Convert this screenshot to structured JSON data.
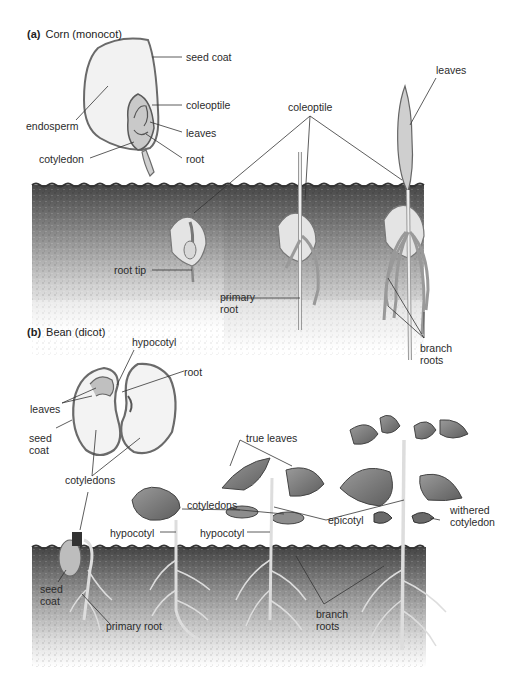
{
  "figure": {
    "colors": {
      "soil_top": "#4a4a4a",
      "soil_bottom": "#f4f4f4",
      "line": "#333333",
      "plant_fill": "#e6e6e6",
      "plant_outline": "#6a6a6a",
      "leaf_dark": "#7a7a7a"
    }
  },
  "panel_a": {
    "letter": "(a)",
    "title": "Corn (monocot)",
    "seed_labels": {
      "seed_coat": "seed coat",
      "endosperm": "endosperm",
      "coleoptile": "coleoptile",
      "leaves": "leaves",
      "cotyledon": "cotyledon",
      "root": "root"
    },
    "seedling_labels": {
      "coleoptile": "coleoptile",
      "leaves": "leaves",
      "root_tip": "root tip",
      "primary_root_1": "primary",
      "primary_root_2": "root",
      "branch_roots_1": "branch",
      "branch_roots_2": "roots"
    }
  },
  "panel_b": {
    "letter": "(b)",
    "title": "Bean (dicot)",
    "seed_labels": {
      "hypocotyl": "hypocotyl",
      "root": "root",
      "leaves": "leaves",
      "seed_coat_1": "seed",
      "seed_coat_2": "coat",
      "cotyledons": "cotyledons"
    },
    "seedling_labels": {
      "true_leaves": "true leaves",
      "cotyledons": "cotyledons",
      "hypocotyl_left": "hypocotyl",
      "hypocotyl_mid": "hypocotyl",
      "epicotyl": "epicotyl",
      "withered_cotyledon_1": "withered",
      "withered_cotyledon_2": "cotyledon",
      "seed_coat_1": "seed",
      "seed_coat_2": "coat",
      "primary_root": "primary root",
      "branch_roots_1": "branch",
      "branch_roots_2": "roots"
    }
  }
}
